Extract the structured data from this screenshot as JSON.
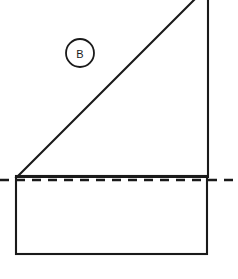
{
  "figure": {
    "background_color": "#ffffff",
    "stroke_color": "#1a1a1a",
    "width": 238,
    "height": 279,
    "label": {
      "text": "B",
      "shape": "circle",
      "center_x": 80,
      "center_y": 53,
      "radius": 14
    },
    "shapes": {
      "triangle": {
        "name": "right-triangle",
        "points": "17,177 208,-14 208,177",
        "description": "Right triangle with apex at lower left, hypotenuse rising at 45 degrees, vertical right leg clipped by the top edge of the image"
      },
      "rectangle": {
        "name": "base-rectangle",
        "x": 16,
        "y": 176,
        "width": 191,
        "height": 78,
        "description": "Rectangle beneath the dashed reference line forming the base of the figure"
      },
      "dashed_line": {
        "name": "center-reference-line",
        "x1": 0,
        "y1": 180,
        "x2": 238,
        "y2": 180,
        "dash_pattern": "9 7",
        "description": "Horizontal dashed reference line spanning the full image width"
      }
    },
    "strokes": {
      "outline_width": 2.1,
      "dashed_width": 2.6,
      "circle_width": 1.8
    }
  }
}
